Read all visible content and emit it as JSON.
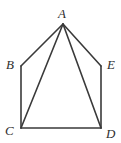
{
  "figure": {
    "shape_name": "pentagon",
    "background_color": "#ffffff",
    "stroke_color": "#3a3a3a",
    "label_color": "#2e2e2e",
    "vertices": [
      {
        "id": "A",
        "label": "A",
        "x": 63,
        "y": 24,
        "label_x": 58,
        "label_y": 7
      },
      {
        "id": "B",
        "label": "B",
        "x": 21,
        "y": 66,
        "label_x": 6,
        "label_y": 58
      },
      {
        "id": "C",
        "label": "C",
        "x": 21,
        "y": 128,
        "label_x": 5,
        "label_y": 124
      },
      {
        "id": "D",
        "label": "D",
        "x": 101,
        "y": 128,
        "label_x": 106,
        "label_y": 127
      },
      {
        "id": "E",
        "label": "E",
        "x": 101,
        "y": 66,
        "label_x": 107,
        "label_y": 58
      }
    ],
    "edges": [
      {
        "name": "edge-ab",
        "from": "A",
        "to": "B",
        "kind": "side"
      },
      {
        "name": "edge-bc",
        "from": "B",
        "to": "C",
        "kind": "side"
      },
      {
        "name": "edge-cd",
        "from": "C",
        "to": "D",
        "kind": "side"
      },
      {
        "name": "edge-de",
        "from": "D",
        "to": "E",
        "kind": "side"
      },
      {
        "name": "edge-ea",
        "from": "E",
        "to": "A",
        "kind": "side"
      },
      {
        "name": "diagonal-ac",
        "from": "A",
        "to": "C",
        "kind": "diagonal"
      },
      {
        "name": "diagonal-ad",
        "from": "A",
        "to": "D",
        "kind": "diagonal"
      }
    ]
  }
}
